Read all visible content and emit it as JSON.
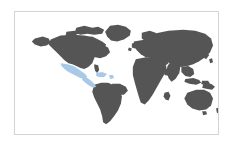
{
  "widget": {
    "name": "world-map",
    "type": "choropleth-locator-map",
    "projection": "equirectangular",
    "background_color": "#ffffff",
    "border_color": "#d4d4d4",
    "frame": {
      "x": 14,
      "y": 11,
      "width": 205,
      "height": 124
    }
  },
  "map": {
    "ocean_color": "#ffffff",
    "land_color": "#555555",
    "highlight_color": "#a9c9e8",
    "antarctica_shown": false,
    "labels_shown": false,
    "graticule_shown": false,
    "highlighted_regions": [
      {
        "name": "Mexico",
        "color": "#a9c9e8"
      },
      {
        "name": "Central America",
        "color": "#a9c9e8"
      },
      {
        "name": "Caribbean",
        "color": "#a9c9e8"
      }
    ],
    "landmasses": [
      "North America",
      "South America",
      "Greenland",
      "Europe",
      "Africa",
      "Asia",
      "Australia",
      "New Zealand",
      "Japan",
      "Indonesia",
      "Madagascar",
      "British Isles"
    ]
  },
  "geometry": {
    "viewbox": "0 0 205 124",
    "shapes": [
      {
        "id": "greenland",
        "kind": "land",
        "d": "M96 14 L104 13 L112 15 L117 19 L116 24 L110 28 L103 30 L97 29 L93 25 L91 20 Z"
      },
      {
        "id": "arctic-islands",
        "kind": "land",
        "d": "M62 16 L70 14 L78 16 L84 15 L90 18 L88 22 L80 23 L73 22 L66 23 L60 21 Z M52 20 L60 19 L64 22 L58 25 L51 24 Z M70 26 L78 25 L82 28 L75 30 L68 29 Z"
      },
      {
        "id": "north-america-main",
        "kind": "land",
        "d": "M36 28 L46 24 L58 23 L70 24 L80 26 L88 30 L92 33 L90 38 L86 41 L82 43 L80 47 L78 52 L74 56 L70 58 L66 57 L62 55 L58 53 L54 52 L50 49 L46 45 L42 41 L38 37 L34 33 Z"
      },
      {
        "id": "north-america-east",
        "kind": "land",
        "d": "M80 32 L88 33 L94 36 L96 41 L92 45 L86 47 L81 46 L78 42 L78 36 Z"
      },
      {
        "id": "alaska",
        "kind": "land",
        "d": "M20 27 L28 25 L34 27 L36 31 L32 34 L26 35 L20 33 L17 30 Z"
      },
      {
        "id": "florida",
        "kind": "land",
        "d": "M80 53 L84 54 L85 59 L83 62 L81 60 L80 56 Z"
      },
      {
        "id": "mexico-highlight",
        "kind": "highlight",
        "d": "M46 52 L53 53 L59 55 L64 58 L68 61 L71 63 L73 66 L70 68 L66 67 L62 65 L58 63 L54 61 L50 58 L47 55 Z"
      },
      {
        "id": "central-america-highlight",
        "kind": "highlight",
        "d": "M68 66 L73 67 L77 70 L80 73 L82 76 L79 77 L75 75 L71 72 L68 69 Z"
      },
      {
        "id": "caribbean-highlight",
        "kind": "highlight",
        "d": "M82 62 L88 61 L93 63 L90 66 L85 66 L82 65 Z M95 64 L99 64 L100 67 L96 68 Z"
      },
      {
        "id": "south-america",
        "kind": "land",
        "d": "M80 74 L87 72 L94 72 L101 75 L106 80 L108 86 L107 93 L104 100 L100 106 L96 111 L92 114 L89 112 L88 106 L86 99 L83 93 L80 87 L78 81 Z"
      },
      {
        "id": "south-america-bulge",
        "kind": "land",
        "d": "M98 73 L106 73 L112 76 L114 80 L110 84 L104 84 L99 80 Z"
      },
      {
        "id": "british-isles",
        "kind": "land",
        "d": "M118 32 L122 31 L124 34 L121 37 L118 36 Z M115 36 L118 37 L117 40 L114 39 Z"
      },
      {
        "id": "europe",
        "kind": "land",
        "d": "M120 30 L132 28 L144 28 L152 31 L154 36 L150 41 L144 45 L138 47 L132 46 L127 43 L123 39 L120 35 Z"
      },
      {
        "id": "scandinavia",
        "kind": "land",
        "d": "M128 21 L136 19 L142 21 L144 26 L139 30 L132 30 L128 27 Z"
      },
      {
        "id": "asia",
        "kind": "land",
        "d": "M140 22 L155 19 L170 18 L182 19 L192 22 L198 27 L200 34 L197 41 L192 46 L186 50 L180 53 L174 55 L168 56 L162 55 L156 52 L150 48 L146 43 L143 37 L141 30 Z"
      },
      {
        "id": "india",
        "kind": "land",
        "d": "M156 52 L163 52 L167 55 L166 62 L162 68 L158 71 L155 67 L153 60 L154 55 Z"
      },
      {
        "id": "middle-east",
        "kind": "land",
        "d": "M140 44 L148 43 L154 46 L155 52 L150 56 L144 56 L139 52 L137 47 Z"
      },
      {
        "id": "southeast-asia",
        "kind": "land",
        "d": "M168 56 L175 55 L180 58 L181 63 L177 66 L172 65 L168 61 Z"
      },
      {
        "id": "japan",
        "kind": "land",
        "d": "M190 42 L194 40 L196 44 L193 48 L190 46 Z M196 48 L199 47 L200 51 L197 52 Z"
      },
      {
        "id": "africa",
        "kind": "land",
        "d": "M122 48 L132 46 L142 47 L150 50 L153 56 L151 63 L147 70 L143 77 L139 84 L135 90 L131 94 L127 92 L125 86 L123 79 L121 72 L119 64 L119 56 Z"
      },
      {
        "id": "africa-horn",
        "kind": "land",
        "d": "M150 58 L157 57 L160 61 L156 65 L151 64 Z"
      },
      {
        "id": "madagascar",
        "kind": "land",
        "d": "M151 82 L155 81 L157 85 L155 90 L152 89 L150 86 Z"
      },
      {
        "id": "indonesia",
        "kind": "land",
        "d": "M172 68 L180 67 L186 69 L188 72 L183 74 L176 73 L171 71 Z M189 70 L195 70 L197 73 L192 75 L188 73 Z"
      },
      {
        "id": "new-guinea",
        "kind": "land",
        "d": "M190 74 L198 73 L202 76 L199 79 L193 78 L189 77 Z"
      },
      {
        "id": "australia",
        "kind": "land",
        "d": "M174 82 L183 79 L191 79 L197 82 L200 88 L198 95 L193 99 L186 100 L179 98 L174 94 L171 88 Z"
      },
      {
        "id": "tasmania",
        "kind": "land",
        "d": "M189 101 L193 101 L194 104 L190 105 Z"
      },
      {
        "id": "new-zealand",
        "kind": "land",
        "d": "M203 98 L206 97 L207 101 L204 103 Z M205 104 L208 104 L208 108 L205 109 Z"
      }
    ]
  }
}
